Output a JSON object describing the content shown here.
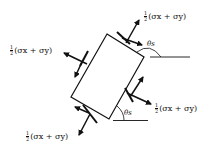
{
  "diagram": {
    "type": "stress element rotated by angle theta_s",
    "labels": {
      "top_right": {
        "frac_num": "1",
        "frac_den": "2",
        "expr": "(σx + σy)"
      },
      "left": {
        "frac_num": "1",
        "frac_den": "2",
        "expr": "(σx + σy)"
      },
      "right": {
        "frac_num": "1",
        "frac_den": "2",
        "expr": "(σx + σy)"
      },
      "bottom_left": {
        "frac_num": "1",
        "frac_den": "2",
        "expr": "(σx + σy)"
      }
    },
    "angles": {
      "top": "θs",
      "bottom": "θs"
    },
    "colors": {
      "stroke": "#111111",
      "background": "#ffffff"
    }
  }
}
